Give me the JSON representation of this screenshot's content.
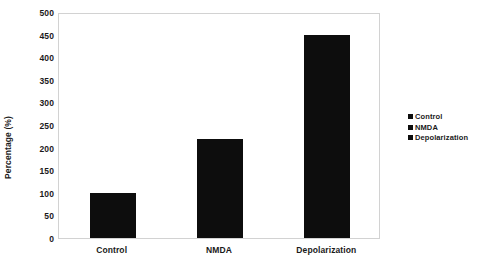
{
  "chart_data": {
    "type": "bar",
    "title": "",
    "subtitle": "",
    "xlabel": "",
    "ylabel": "Percentage (%)",
    "categories": [
      "Control",
      "NMDA",
      "Depolarization"
    ],
    "values": [
      100,
      220,
      450
    ],
    "series": [
      {
        "name": "Percentage",
        "values": [
          100,
          220,
          450
        ],
        "color": "#0d0d0d"
      }
    ],
    "ylim": [
      0,
      500
    ],
    "ytick_step": 50,
    "yticks": [
      500,
      450,
      400,
      350,
      300,
      250,
      200,
      150,
      100,
      50,
      0
    ],
    "ytick_labels": [
      "500",
      "450",
      "400",
      "350",
      "300",
      "250",
      "200",
      "150",
      "100",
      "50",
      "0"
    ],
    "grid": false,
    "legend_position": "right",
    "legend": [
      {
        "label": "Control",
        "color": "#0d0d0d"
      },
      {
        "label": "NMDA",
        "color": "#0d0d0d"
      },
      {
        "label": "Depolarization",
        "color": "#0d0d0d"
      }
    ],
    "annotations": [],
    "plot_border_color": "#d2d2d2",
    "background_color": "#ffffff"
  }
}
